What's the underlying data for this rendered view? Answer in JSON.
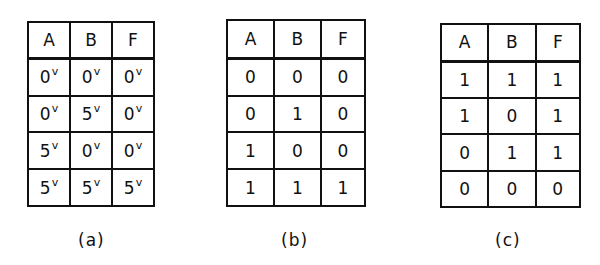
{
  "tables": [
    {
      "caption": "(a)",
      "headers": [
        "A",
        "B",
        "F"
      ],
      "unit_superscript": "v",
      "rows": [
        [
          "0",
          "0",
          "0"
        ],
        [
          "0",
          "5",
          "0"
        ],
        [
          "5",
          "0",
          "0"
        ],
        [
          "5",
          "5",
          "5"
        ]
      ]
    },
    {
      "caption": "(b)",
      "headers": [
        "A",
        "B",
        "F"
      ],
      "rows": [
        [
          "0",
          "0",
          "0"
        ],
        [
          "0",
          "1",
          "0"
        ],
        [
          "1",
          "0",
          "0"
        ],
        [
          "1",
          "1",
          "1"
        ]
      ]
    },
    {
      "caption": "(c)",
      "headers": [
        "A",
        "B",
        "F"
      ],
      "rows": [
        [
          "1",
          "1",
          "1"
        ],
        [
          "1",
          "0",
          "1"
        ],
        [
          "0",
          "1",
          "1"
        ],
        [
          "0",
          "0",
          "0"
        ]
      ]
    }
  ]
}
